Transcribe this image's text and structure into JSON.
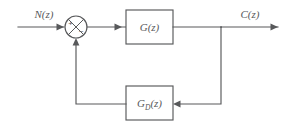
{
  "diagram": {
    "type": "control-system-block-diagram",
    "background_color": "#ffffff",
    "line_color": "#58595b",
    "input": {
      "label": "N(z)",
      "arrow_direction": "right"
    },
    "output": {
      "label": "C(z)",
      "arrow_direction": "right"
    },
    "summing_junction": {
      "name": "summing-junction",
      "style": "circle-with-x-cross",
      "input_sign": "+",
      "feedback_sign": "−"
    },
    "forward_block": {
      "label": "G(z)",
      "label_main": "G",
      "label_args": "(z)"
    },
    "feedback_block": {
      "label": "G_D(z)",
      "label_main": "G",
      "label_subscript": "D",
      "label_args": "(z)"
    },
    "takeoff_point": {
      "name": "takeoff-junction"
    }
  }
}
